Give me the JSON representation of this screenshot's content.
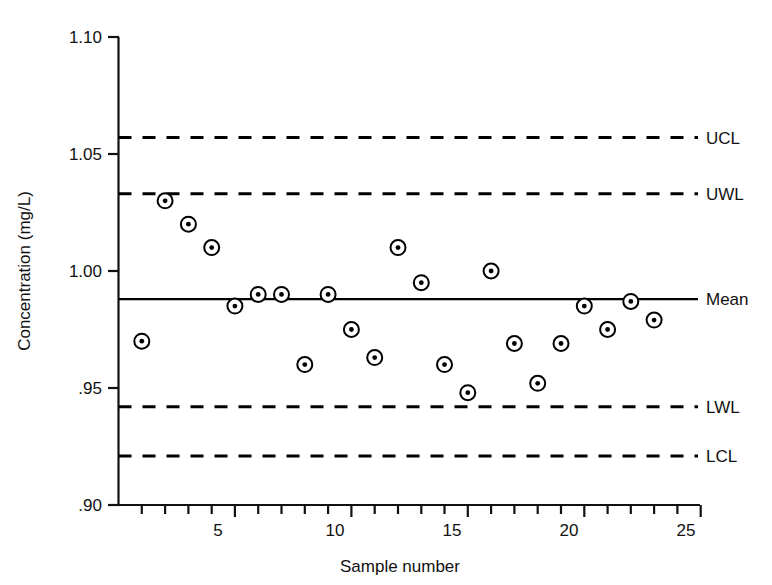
{
  "chart_data": {
    "type": "scatter",
    "title": "",
    "xlabel": "Sample number",
    "ylabel": "Concentration (mg/L)",
    "xlim": [
      0,
      26
    ],
    "ylim": [
      0.9,
      1.1
    ],
    "grid": false,
    "legend_position": "right-outside",
    "x_ticks": [
      5,
      10,
      15,
      20,
      25
    ],
    "x_tick_labels": [
      "5",
      "10",
      "15",
      "20",
      "25"
    ],
    "x_minor_ticks": [
      1,
      2,
      3,
      4,
      5,
      6,
      7,
      8,
      9,
      10,
      11,
      12,
      13,
      14,
      15,
      16,
      17,
      18,
      19,
      20,
      21,
      22,
      23,
      24,
      25
    ],
    "y_ticks": [
      0.9,
      0.95,
      1.0,
      1.05,
      1.1
    ],
    "y_tick_labels": [
      ".90",
      ".95",
      "1.00",
      "1.05",
      "1.10"
    ],
    "marker": "circle-with-center-dot",
    "x": [
      1,
      2,
      3,
      4,
      5,
      6,
      7,
      8,
      9,
      10,
      11,
      12,
      13,
      14,
      15,
      16,
      17,
      18,
      19,
      20,
      21,
      22,
      23
    ],
    "values": [
      0.97,
      1.03,
      1.02,
      1.01,
      0.985,
      0.99,
      0.99,
      0.96,
      0.99,
      0.975,
      0.963,
      1.01,
      0.995,
      0.96,
      0.948,
      1.0,
      0.969,
      0.952,
      0.969,
      0.985,
      0.975,
      0.987,
      0.979
    ],
    "series": [
      {
        "name": "Concentration",
        "values": [
          0.97,
          1.03,
          1.02,
          1.01,
          0.985,
          0.99,
          0.99,
          0.96,
          0.99,
          0.975,
          0.963,
          1.01,
          0.995,
          0.96,
          0.948,
          1.0,
          0.969,
          0.952,
          0.969,
          0.985,
          0.975,
          0.987,
          0.979
        ]
      }
    ],
    "reference_lines": [
      {
        "key": "ucl",
        "label": "UCL",
        "value": 1.057,
        "style": "dashed"
      },
      {
        "key": "uwl",
        "label": "UWL",
        "value": 1.033,
        "style": "dashed"
      },
      {
        "key": "mean",
        "label": "Mean",
        "value": 0.988,
        "style": "solid"
      },
      {
        "key": "lwl",
        "label": "LWL",
        "value": 0.942,
        "style": "dashed"
      },
      {
        "key": "lcl",
        "label": "LCL",
        "value": 0.921,
        "style": "dashed"
      }
    ]
  },
  "axes": {
    "y_title": "Concentration (mg/L)",
    "x_title": "Sample number",
    "y_labels": {
      "t110": "1.10",
      "t105": "1.05",
      "t100": "1.00",
      "t095": ".95",
      "t090": ".90"
    },
    "x_labels": {
      "t5": "5",
      "t10": "10",
      "t15": "15",
      "t20": "20",
      "t25": "25"
    }
  },
  "limits": {
    "ucl_label": "UCL",
    "uwl_label": "UWL",
    "mean_label": "Mean",
    "lwl_label": "LWL",
    "lcl_label": "LCL"
  },
  "colors": {
    "ink": "#000000",
    "background": "#ffffff"
  }
}
